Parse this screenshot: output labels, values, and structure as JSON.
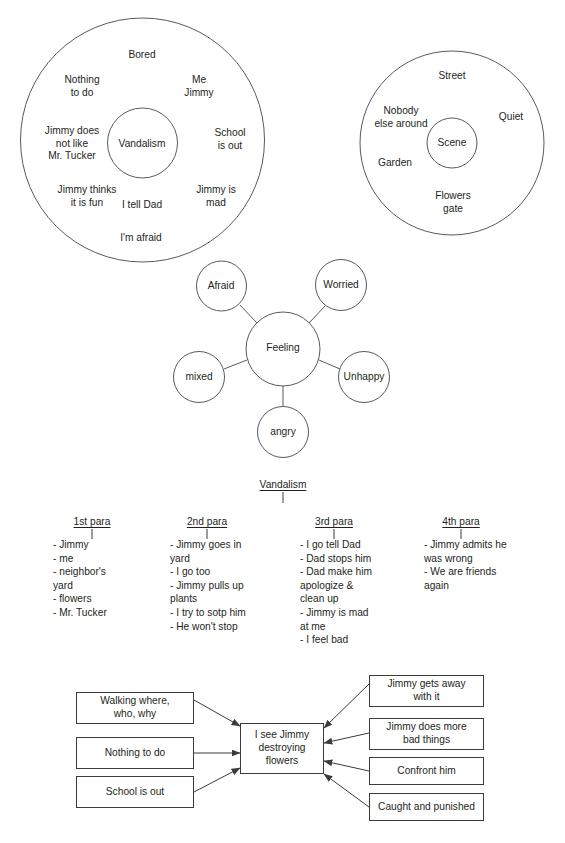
{
  "page": {
    "width": 565,
    "height": 843,
    "background": "#ffffff",
    "ink_color": "#231f20",
    "line_color": "#3b3b3b"
  },
  "bubble_map_topic": {
    "name": "vandalism-bubble-map",
    "center_label": "Vandalism",
    "outer_labels": [
      "Bored",
      "Nothing\nto do",
      "Me\nJimmy",
      "Jimmy does\nnot like\nMr. Tucker",
      "School\nis out",
      "Jimmy thinks\nit is fun",
      "Jimmy is\nmad",
      "I tell Dad",
      "I'm afraid"
    ]
  },
  "bubble_map_scene": {
    "name": "scene-bubble-map",
    "center_label": "Scene",
    "outer_labels": [
      "Street",
      "Nobody\nelse around",
      "Quiet",
      "Garden",
      "Flowers\ngate"
    ]
  },
  "feeling_web": {
    "name": "feeling-web",
    "center_label": "Feeling",
    "nodes": [
      "Afraid",
      "Worried",
      "Unhappy",
      "angry",
      "mixed"
    ]
  },
  "outline": {
    "topic": "Vandalism",
    "columns": [
      {
        "heading": "1st para",
        "items": [
          "- Jimmy",
          "- me",
          "- neighbor's",
          "  yard",
          "- flowers",
          "- Mr. Tucker"
        ]
      },
      {
        "heading": "2nd para",
        "items": [
          "- Jimmy goes in",
          "  yard",
          "- I go too",
          "- Jimmy pulls up",
          "  plants",
          "- I try to sotp him",
          "- He won't stop"
        ]
      },
      {
        "heading": "3rd para",
        "items": [
          "- I go tell Dad",
          "- Dad stops him",
          "- Dad make him",
          "  apologize &",
          "  clean up",
          "- Jimmy is mad",
          "  at me",
          "- I feel bad"
        ]
      },
      {
        "heading": "4th para",
        "items": [
          "- Jimmy admits he",
          "  was wrong",
          "- We are friends",
          "  again"
        ]
      }
    ]
  },
  "flow_chart": {
    "name": "cause-effect-flow-chart",
    "center_box": "I see Jimmy\ndestroying\nflowers",
    "left_boxes": [
      "Walking where,\nwho, why",
      "Nothing to do",
      "School is out"
    ],
    "right_boxes": [
      "Jimmy gets away\nwith it",
      "Jimmy does more\nbad things",
      "Confront him",
      "Caught and punished"
    ]
  }
}
